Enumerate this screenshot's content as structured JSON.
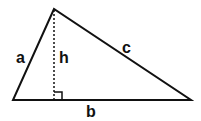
{
  "diagram": {
    "type": "triangle",
    "labels": {
      "side_a": "a",
      "side_b": "b",
      "side_c": "c",
      "height": "h"
    },
    "stroke_color": "#111111",
    "background": "#ffffff"
  }
}
